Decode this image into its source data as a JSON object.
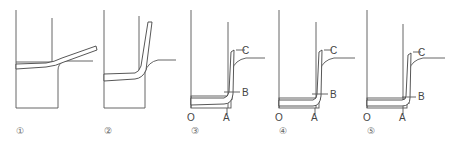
{
  "figure": {
    "line_color": "#555555",
    "background": "#ffffff",
    "panels": [
      {
        "id": 1,
        "step_label": "①",
        "labels": []
      },
      {
        "id": 2,
        "step_label": "②",
        "labels": []
      },
      {
        "id": 3,
        "step_label": "③",
        "labels": {
          "origin": "O",
          "a": "A",
          "b": "B",
          "c": "C"
        }
      },
      {
        "id": 4,
        "step_label": "④",
        "labels": {
          "origin": "O",
          "a": "A",
          "b": "B",
          "c": "C"
        }
      },
      {
        "id": 5,
        "step_label": "⑤",
        "labels": {
          "origin": "O",
          "a": "A",
          "b": "B",
          "c": "C"
        }
      }
    ]
  }
}
